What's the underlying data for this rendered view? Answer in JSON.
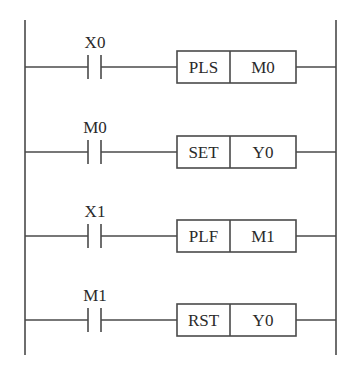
{
  "diagram": {
    "type": "ladder-logic",
    "rails": {
      "left_x": 25,
      "right_x": 336,
      "top_y": 20,
      "bottom_y": 355
    },
    "rungs": [
      {
        "contact": "X0",
        "instruction": "PLS",
        "operand": "M0",
        "y": 67
      },
      {
        "contact": "M0",
        "instruction": "SET",
        "operand": "Y0",
        "y": 152
      },
      {
        "contact": "X1",
        "instruction": "PLF",
        "operand": "M1",
        "y": 236
      },
      {
        "contact": "M1",
        "instruction": "RST",
        "operand": "Y0",
        "y": 320
      }
    ]
  }
}
